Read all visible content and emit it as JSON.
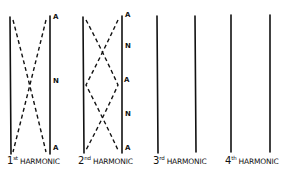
{
  "colors": {
    "ink": "#111111",
    "background": "#ffffff"
  },
  "harmonics": [
    {
      "number": "1",
      "suffix": "st",
      "word": "HARMONIC",
      "markers": [
        {
          "text": "A",
          "y": 20
        },
        {
          "text": "N",
          "y": 85
        },
        {
          "text": "A",
          "y": 150
        }
      ]
    },
    {
      "number": "2",
      "suffix": "nd",
      "word": "HARMONIC",
      "markers": [
        {
          "text": "A",
          "y": 20
        },
        {
          "text": "N",
          "y": 52
        },
        {
          "text": "A",
          "y": 85
        },
        {
          "text": "N",
          "y": 117
        },
        {
          "text": "A",
          "y": 150
        }
      ]
    },
    {
      "number": "3",
      "suffix": "rd",
      "word": "HARMONIC",
      "markers": []
    },
    {
      "number": "4",
      "suffix": "th",
      "word": "HARMONIC",
      "markers": []
    }
  ]
}
